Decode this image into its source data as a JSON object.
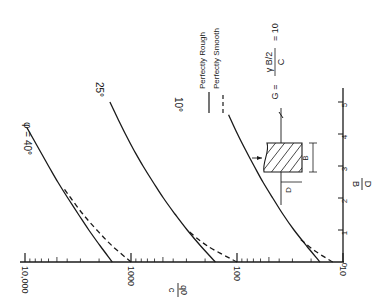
{
  "chart_data": {
    "type": "line",
    "orientation": "rotated-90",
    "title": "",
    "xlabel": "D/B",
    "ylabel": "q0/c",
    "x_axis": {
      "label_num": "D",
      "label_den": "B",
      "range": [
        0,
        5
      ],
      "ticks": [
        "0",
        "1",
        "2",
        "3",
        "4",
        "5"
      ]
    },
    "y_axis": {
      "label_num": "q0",
      "label_den": "c",
      "scale": "log",
      "range": [
        10,
        10000
      ],
      "ticks": [
        "10",
        "100",
        "1000",
        "10,000"
      ]
    },
    "parameter_note": {
      "lhs": "G =",
      "num": "γ B/2",
      "den": "C",
      "rhs": "= 10"
    },
    "legend": [
      {
        "name": "Perfectly Rough",
        "style": "solid"
      },
      {
        "name": "Perfectly Smooth",
        "style": "dashed"
      }
    ],
    "legend_position": "top-right",
    "inset": {
      "labels": [
        "D",
        "B"
      ]
    },
    "series": [
      {
        "name": "φ = 40° Perfectly Rough",
        "label": "φ = 40°",
        "style": "solid",
        "x": [
          0,
          0.5,
          1,
          1.5,
          2,
          2.5,
          3,
          3.5,
          4.2
        ],
        "y": [
          1500,
          1950,
          2500,
          3150,
          3950,
          4900,
          6000,
          7300,
          9600
        ]
      },
      {
        "name": "φ = 40° Perfectly Smooth",
        "style": "dashed",
        "x": [
          0,
          0.5,
          1,
          1.5,
          2,
          2.3
        ],
        "y": [
          1000,
          1500,
          2100,
          2850,
          3700,
          4300
        ]
      },
      {
        "name": "φ = 25° Perfectly Rough",
        "label": "25°",
        "style": "solid",
        "x": [
          0,
          0.5,
          1,
          1.5,
          2,
          2.5,
          3,
          3.5,
          4,
          4.5,
          5.0
        ],
        "y": [
          160,
          220,
          295,
          385,
          495,
          620,
          770,
          940,
          1130,
          1340,
          1580
        ]
      },
      {
        "name": "φ = 25° Perfectly Smooth",
        "style": "dashed",
        "x": [
          0,
          0.5,
          1.0
        ],
        "y": [
          100,
          190,
          295
        ]
      },
      {
        "name": "φ = 10° Perfectly Rough",
        "label": "10°",
        "style": "solid",
        "x": [
          0,
          0.5,
          1,
          1.5,
          2,
          2.5,
          3,
          3.5,
          4,
          4.6
        ],
        "y": [
          16.5,
          22,
          29,
          37,
          46,
          57,
          69,
          83,
          99,
          120
        ]
      },
      {
        "name": "φ = 10° Perfectly Smooth",
        "style": "dashed",
        "x": [
          0,
          0.35,
          0.7
        ],
        "y": [
          12.5,
          18.5,
          25
        ]
      }
    ]
  }
}
